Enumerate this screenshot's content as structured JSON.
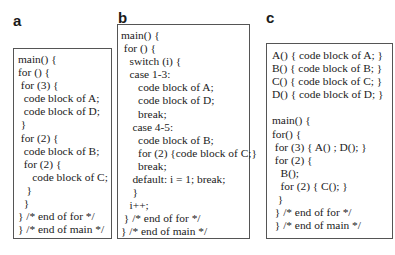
{
  "panels": [
    {
      "label": "a",
      "lines": [
        "main() {",
        "for () {",
        " for (3) {",
        "  code block of A;",
        "  code block of D;",
        " }",
        " for (2) {",
        "  code block of B;",
        "  for (2) {",
        "     code block of C;",
        "   }",
        "  }",
        "} /* end of for */",
        "} /* end of main */"
      ]
    },
    {
      "label": "b",
      "lines": [
        "main() {",
        " for () {",
        "   switch (i) {",
        "   case 1-3:",
        "      code block of A;",
        "      code block of D;",
        "      break;",
        "    case 4-5:",
        "      code block of B;",
        "      for (2) {code block of C;}",
        "      break;",
        "    default: i = 1; break;",
        "    }",
        "   i++;",
        " } /* end of for */",
        "} /* end of main */"
      ]
    },
    {
      "label": "c",
      "lines": [
        "A() { code block of A; }",
        "B() { code block of B; }",
        "C() { code block of C; }",
        "D() { code block of D; }",
        "",
        "main() {",
        "for() {",
        " for (3) { A() ; D(); }",
        " for (2) {",
        "   B();",
        "   for (2) { C(); }",
        "  }",
        " } /* end of for */",
        " } /* end of main */"
      ]
    }
  ]
}
